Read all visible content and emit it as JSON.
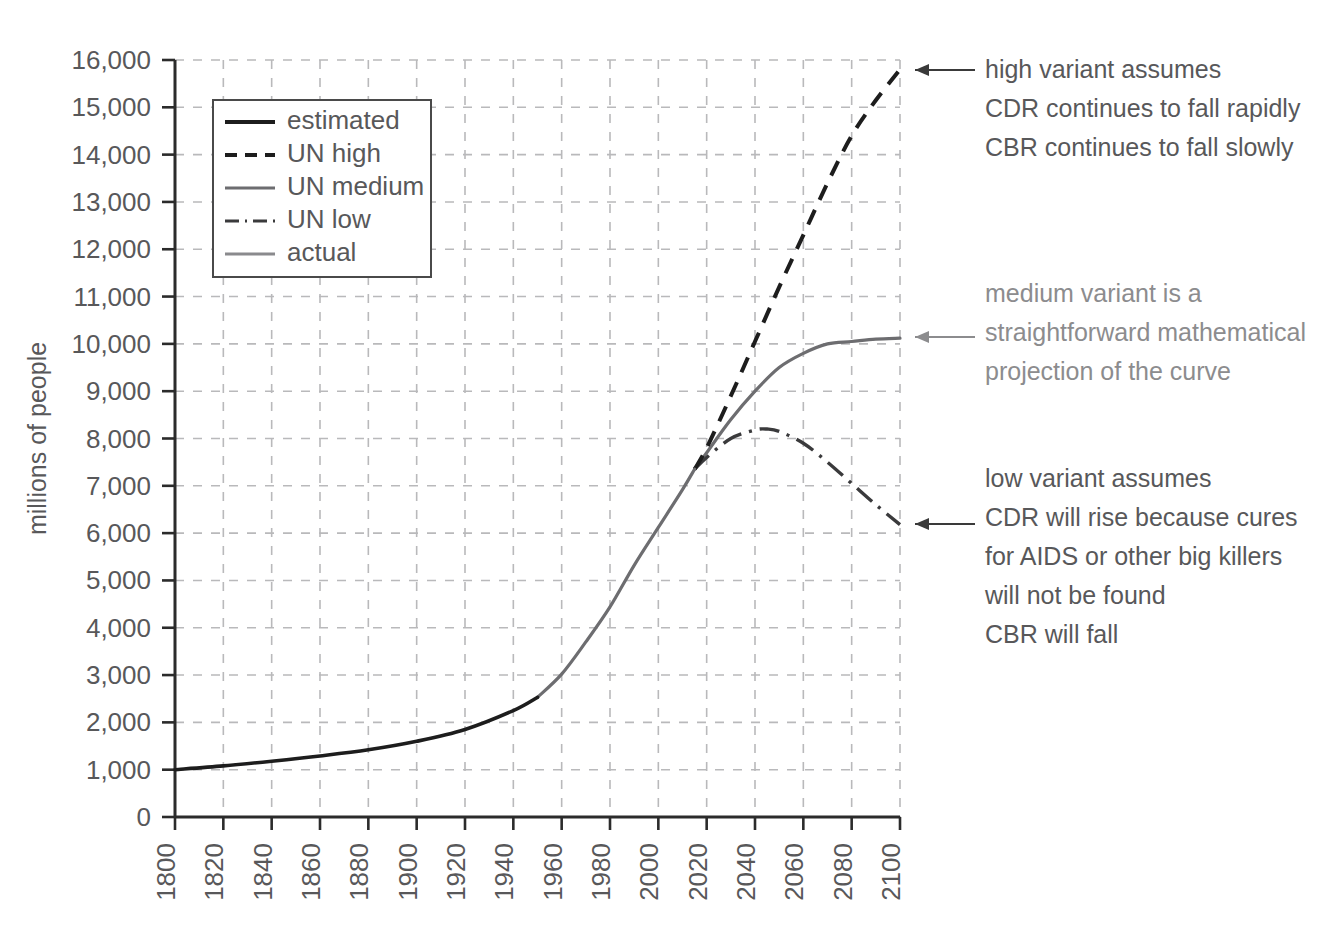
{
  "chart_data": {
    "type": "line",
    "title": "",
    "xlabel": "",
    "ylabel": "millions of people",
    "xlim": [
      1800,
      2100
    ],
    "ylim": [
      0,
      16000
    ],
    "grid": true,
    "legend_position": "top-left-inside",
    "x_ticks": [
      1800,
      1820,
      1840,
      1860,
      1880,
      1900,
      1920,
      1940,
      1960,
      1980,
      2000,
      2020,
      2040,
      2060,
      2080,
      2100
    ],
    "y_ticks": [
      0,
      1000,
      2000,
      3000,
      4000,
      5000,
      6000,
      7000,
      8000,
      9000,
      10000,
      11000,
      12000,
      13000,
      14000,
      15000,
      16000
    ],
    "y_tick_labels": [
      "0",
      "1,000",
      "2,000",
      "3,000",
      "4,000",
      "5,000",
      "6,000",
      "7,000",
      "8,000",
      "9,000",
      "10,000",
      "11,000",
      "12,000",
      "13,000",
      "14,000",
      "15,000",
      "16,000"
    ],
    "x_tick_labels": [
      "1800",
      "1820",
      "1840",
      "1860",
      "1880",
      "1900",
      "1920",
      "1940",
      "1960",
      "1980",
      "2000",
      "2020",
      "2040",
      "2060",
      "2080",
      "2100"
    ],
    "series": [
      {
        "name": "estimated",
        "style": "solid-black-thick",
        "x": [
          1800,
          1820,
          1840,
          1860,
          1880,
          1900,
          1920,
          1940,
          1950
        ],
        "values": [
          1000,
          1080,
          1180,
          1290,
          1420,
          1600,
          1850,
          2250,
          2530
        ]
      },
      {
        "name": "actual",
        "style": "solid-gray",
        "x": [
          1950,
          1960,
          1970,
          1980,
          1990,
          2000,
          2010,
          2015
        ],
        "values": [
          2530,
          3020,
          3700,
          4440,
          5320,
          6120,
          6920,
          7350
        ]
      },
      {
        "name": "UN high",
        "style": "dashed-black",
        "x": [
          2015,
          2020,
          2030,
          2040,
          2050,
          2060,
          2070,
          2080,
          2090,
          2100
        ],
        "values": [
          7350,
          7800,
          8900,
          10050,
          11200,
          12300,
          13400,
          14400,
          15150,
          15800
        ]
      },
      {
        "name": "UN medium",
        "style": "solid-gray",
        "x": [
          2015,
          2020,
          2030,
          2040,
          2050,
          2060,
          2070,
          2080,
          2090,
          2100
        ],
        "values": [
          7350,
          7700,
          8400,
          9000,
          9500,
          9800,
          10000,
          10050,
          10100,
          10120
        ]
      },
      {
        "name": "UN low",
        "style": "dash-dot",
        "x": [
          2015,
          2020,
          2030,
          2040,
          2045,
          2050,
          2060,
          2070,
          2080,
          2090,
          2100
        ],
        "values": [
          7350,
          7600,
          8000,
          8180,
          8200,
          8150,
          7900,
          7500,
          7050,
          6600,
          6180
        ]
      }
    ],
    "annotations": [
      {
        "id": "high-variant",
        "target_series": "UN high",
        "target_point": [
          2100,
          15800
        ],
        "tone": "dark",
        "lines": [
          "high variant assumes",
          "CDR continues to fall rapidly",
          "CBR continues to fall slowly"
        ]
      },
      {
        "id": "medium-variant",
        "target_series": "UN medium",
        "target_point": [
          2100,
          10120
        ],
        "tone": "light",
        "lines": [
          "medium variant is a",
          "straightforward mathematical",
          "projection of the curve"
        ]
      },
      {
        "id": "low-variant",
        "target_series": "UN low",
        "target_point": [
          2100,
          6180
        ],
        "tone": "dark",
        "lines": [
          "low variant assumes",
          "CDR will rise because cures",
          "for AIDS or other big killers",
          "will not be found",
          "CBR will fall"
        ]
      }
    ],
    "legend": [
      {
        "label": "estimated",
        "style": "solid-black-thick"
      },
      {
        "label": "UN high",
        "style": "dashed-black"
      },
      {
        "label": "UN medium",
        "style": "solid-gray"
      },
      {
        "label": "UN low",
        "style": "dash-dot"
      },
      {
        "label": "actual",
        "style": "solid-light-gray"
      }
    ],
    "colors": {
      "estimated": "#1d1d1d",
      "un_high": "#1d1d1d",
      "un_medium": "#6d6d70",
      "un_low": "#3a3a3c",
      "actual": "#8a8a8d",
      "grid": "#b9b9bb",
      "axis": "#2b2b2b",
      "text": "#58585a",
      "text_light": "#8c8c8e",
      "background": "#ffffff"
    }
  }
}
